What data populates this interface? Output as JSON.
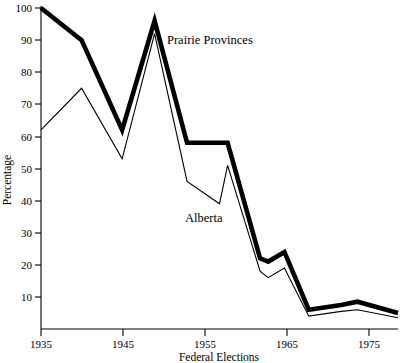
{
  "chart_data": {
    "type": "line",
    "title": "",
    "xlabel": "Federal Elections",
    "ylabel": "Percentage",
    "x": [
      1935,
      1940,
      1945,
      1949,
      1953,
      1957,
      1958,
      1962,
      1963,
      1965,
      1968,
      1972,
      1974,
      1979
    ],
    "xlim": [
      1935,
      1979
    ],
    "ylim": [
      0,
      100
    ],
    "xticks": [
      1935,
      1945,
      1955,
      1965,
      1975
    ],
    "xticklabels": [
      "1935",
      "1945",
      "1955",
      "1965",
      "1975"
    ],
    "yticks": [
      10,
      20,
      30,
      40,
      50,
      60,
      70,
      80,
      90,
      100
    ],
    "yticklabels": [
      "10",
      "20",
      "30",
      "40",
      "50",
      "60",
      "70",
      "80",
      "90",
      "100"
    ],
    "grid": false,
    "legend": "inline-annotations",
    "series": [
      {
        "name": "Prairie Provinces",
        "style": "thick",
        "values": [
          100,
          90,
          62,
          96,
          58,
          58,
          58,
          22,
          21,
          24,
          6,
          7.5,
          8.5,
          5
        ]
      },
      {
        "name": "Alberta",
        "style": "thin",
        "values": [
          62,
          75,
          53,
          92,
          46,
          39,
          51,
          18,
          16,
          19,
          4,
          5.5,
          6,
          3.5
        ]
      }
    ],
    "annotations": [
      {
        "text": "Prairie Provinces",
        "x": 1949.8,
        "y": 92
      },
      {
        "text": "Alberta",
        "x": 1956.0,
        "y": 31
      }
    ],
    "colors": {
      "series_prairie": "#000000",
      "series_alberta": "#000000",
      "axis": "#000000",
      "background": "#ffffff"
    }
  }
}
